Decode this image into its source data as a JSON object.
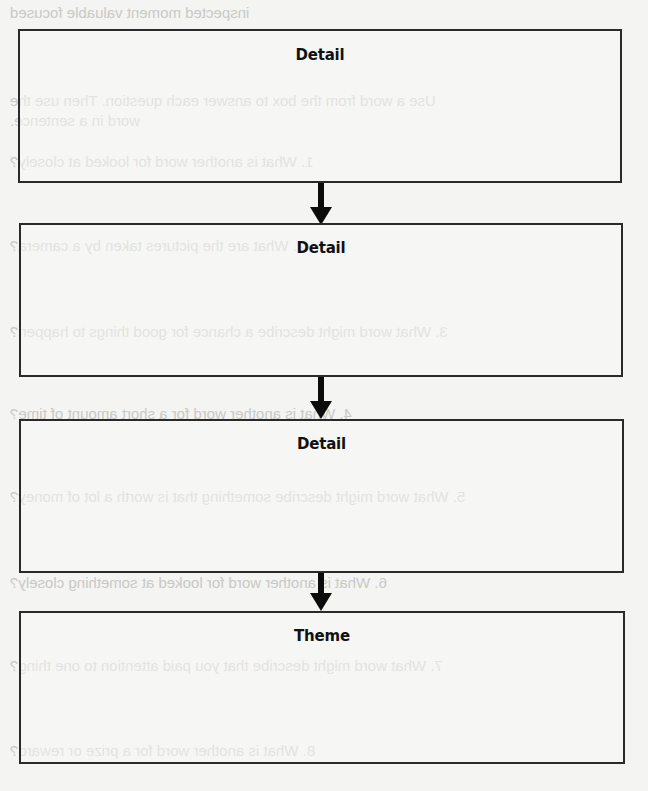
{
  "diagram": {
    "type": "flowchart",
    "direction": "top-to-bottom",
    "boxes": [
      {
        "label": "Detail"
      },
      {
        "label": "Detail"
      },
      {
        "label": "Detail"
      },
      {
        "label": "Theme"
      }
    ],
    "connectors": [
      {
        "from": 0,
        "to": 1,
        "style": "arrow-down"
      },
      {
        "from": 1,
        "to": 2,
        "style": "arrow-down"
      },
      {
        "from": 2,
        "to": 3,
        "style": "arrow-down"
      }
    ],
    "colors": {
      "border": "#2a2a2a",
      "arrow": "#0c0c0c",
      "background": "#f4f4f2",
      "bleed_text": "#c9c9c6"
    }
  },
  "bleed_through": {
    "lines": [
      "inspected        moment        valuable        focused",
      "Use a word from the box to answer each question. Then use the",
      "word in a sentence.",
      "1.  What is another word for looked at closely?",
      "2.  What are the pictures taken by a camera?",
      "3.  What word might describe a chance for good things to happen?",
      "4.  What is another word for a short amount of time?",
      "5.  What word might describe something that is worth a lot of money?",
      "6.  What is another word for looked at something closely?",
      "7.  What word might describe that you paid attention to one thing?",
      "8.  What is another word for a prize or reward?"
    ]
  }
}
